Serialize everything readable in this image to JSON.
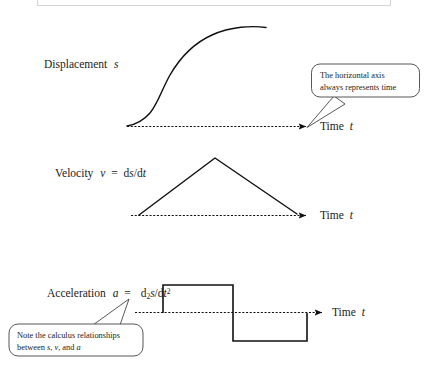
{
  "figure": {
    "title_hidden_box": "partial-bordered-box-top",
    "axis_label": "Time",
    "axis_label_var": "t"
  },
  "panels": [
    {
      "id": "displacement",
      "label_prefix": "Displacement",
      "label_var": "s",
      "curve_type": "s-curve",
      "axis_label": "Time",
      "axis_label_var": "t"
    },
    {
      "id": "velocity",
      "label_prefix": "Velocity",
      "label_var": "v",
      "label_eq": "=",
      "label_formula_pre": "d",
      "label_formula_num": "s",
      "label_formula_slash": "/d",
      "label_formula_den": "t",
      "curve_type": "triangle",
      "axis_label": "Time",
      "axis_label_var": "t"
    },
    {
      "id": "acceleration",
      "label_prefix": "Acceleration",
      "label_var": "a",
      "label_eq": "=",
      "label_formula_pre": "d",
      "label_formula_sub": "2",
      "label_formula_num": "s",
      "label_formula_slash": "/d",
      "label_formula_den": "t",
      "label_formula_sup": "2",
      "curve_type": "square-wave",
      "axis_label": "Time",
      "axis_label_var": "t"
    }
  ],
  "callouts": [
    {
      "id": "horizontal-axis-note",
      "line1": "The horizontal axis",
      "line2": "always represents time"
    },
    {
      "id": "calculus-note",
      "line1": "Note the calculus relationships",
      "line2_pre": "between ",
      "line2_s": "s",
      "line2_mid1": ", ",
      "line2_v": "v",
      "line2_mid2": ", and ",
      "line2_a": "a"
    }
  ],
  "colors": {
    "ink": "#1a1a1a",
    "box_border": "#d2d4d8",
    "background": "#ffffff"
  }
}
